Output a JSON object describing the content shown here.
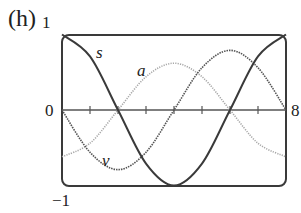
{
  "panel_label": "(h)",
  "axes": {
    "y_top_label": "1",
    "y_zero_label": "0",
    "y_bottom_label": "−1",
    "x_end_label": "8"
  },
  "curve_labels": {
    "s": "s",
    "a": "a",
    "v": "v"
  },
  "colors": {
    "s": "#3a3a3a",
    "v": "#555555",
    "a": "#a8a8a8",
    "frame": "#3a3a3a",
    "axis": "#555555"
  },
  "chart_data": {
    "type": "line",
    "title": "(h)",
    "xlabel": "",
    "ylabel": "",
    "xlim": [
      0,
      8
    ],
    "ylim": [
      -1,
      1
    ],
    "x_ticks": [
      0,
      1,
      2,
      3,
      4,
      5,
      6,
      7,
      8
    ],
    "x_tick_labels_shown": [
      "0",
      "8"
    ],
    "y_tick_labels_shown": [
      "1",
      "0",
      "-1"
    ],
    "grid": false,
    "legend": "inline labels",
    "x": [
      0,
      1,
      2,
      3,
      4,
      5,
      6,
      7,
      8
    ],
    "series": [
      {
        "name": "s",
        "style": "solid dark",
        "values": [
          1.0,
          0.71,
          0.0,
          -0.71,
          -1.0,
          -0.71,
          0.0,
          0.71,
          1.0
        ]
      },
      {
        "name": "v",
        "style": "dotted dark",
        "values": [
          0.0,
          -0.56,
          -0.79,
          -0.56,
          0.0,
          0.56,
          0.79,
          0.56,
          0.0
        ]
      },
      {
        "name": "a",
        "style": "dotted light gray",
        "values": [
          -0.62,
          -0.44,
          0.0,
          0.44,
          0.62,
          0.44,
          0.0,
          -0.44,
          -0.62
        ]
      }
    ]
  }
}
